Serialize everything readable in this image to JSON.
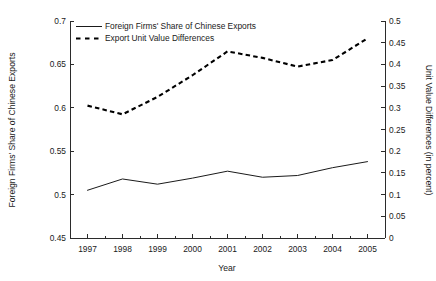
{
  "chart_data": {
    "type": "line",
    "title": "",
    "subtitle": "",
    "xlabel": "Year",
    "ylabel": "Foreign Firms' Share of Chinese Exports",
    "y2label": "Unit Value Differences (in percent)",
    "x": [
      1997,
      1998,
      1999,
      2000,
      2001,
      2002,
      2003,
      2004,
      2005
    ],
    "categories": [
      "1997",
      "1998",
      "1999",
      "2000",
      "2001",
      "2002",
      "2003",
      "2004",
      "2005"
    ],
    "xlim": [
      1996.5,
      2005.5
    ],
    "ylim": [
      0.45,
      0.7
    ],
    "y2lim": [
      0,
      0.5
    ],
    "yticks": [
      0.45,
      0.5,
      0.55,
      0.6,
      0.65,
      0.7
    ],
    "ytick_labels": [
      "0.45",
      "0.5",
      "0.55",
      "0.6",
      "0.65",
      "0.7"
    ],
    "y2ticks": [
      0,
      0.05,
      0.1,
      0.15,
      0.2,
      0.25,
      0.3,
      0.35,
      0.4,
      0.45,
      0.5
    ],
    "y2tick_labels": [
      "0",
      "0.05",
      "0.1",
      "0.15",
      "0.2",
      "0.25",
      "0.3",
      "0.35",
      "0.4",
      "0.45",
      "0.5"
    ],
    "xtick_labels": [
      "1997",
      "1998",
      "1999",
      "2000",
      "2001",
      "2002",
      "2003",
      "2004",
      "2005"
    ],
    "grid": false,
    "legend_position": "top-left",
    "series": [
      {
        "name": "Foreign Firms' Share of Chinese Exports",
        "axis": "left",
        "style": "solid",
        "color": "#1a1a1a",
        "values": [
          0.505,
          0.518,
          0.512,
          0.519,
          0.527,
          0.52,
          0.522,
          0.531,
          0.538
        ]
      },
      {
        "name": "Export Unit Value Differences",
        "axis": "right",
        "style": "dashed",
        "color": "#000000",
        "values": [
          0.305,
          0.285,
          0.325,
          0.375,
          0.43,
          0.415,
          0.395,
          0.41,
          0.46
        ]
      }
    ]
  },
  "legend": {
    "entries": [
      {
        "label": "Foreign Firms' Share of Chinese Exports"
      },
      {
        "label": "Export Unit Value Differences"
      }
    ]
  },
  "axes": {
    "x_title": "Year",
    "y_left_title": "Foreign Firms' Share of Chinese Exports",
    "y_right_title": "Unit Value Differences (in percent)"
  },
  "colors": {
    "axis": "#2b2b2b",
    "text": "#1a1a1a",
    "series_solid": "#1a1a1a",
    "series_dashed": "#000000",
    "background": "#ffffff"
  }
}
